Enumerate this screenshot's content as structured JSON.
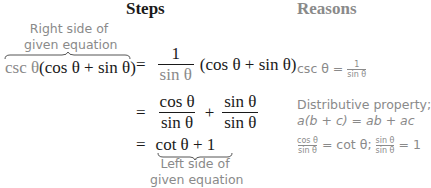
{
  "headers": {
    "steps": "Steps",
    "reasons": "Reasons"
  },
  "annotations": {
    "top": [
      "Right side of",
      "given equation"
    ],
    "bottom": [
      "Left side of",
      "given equation"
    ]
  },
  "steps": [
    {
      "lhs_gray": "csc θ",
      "lhs_rest": "(cos θ + sin θ)",
      "eq": "=",
      "frac_num": "1",
      "frac_den": "sin θ",
      "tail": "(cos θ + sin θ)"
    },
    {
      "eq": "=",
      "f1_num": "cos θ",
      "f1_den": "sin θ",
      "op": "+",
      "f2_num": "sin θ",
      "f2_den": "sin θ"
    },
    {
      "eq": "=",
      "expr": "cot θ + 1"
    }
  ],
  "reasons": [
    {
      "pre": "csc θ =",
      "num": "1",
      "den": "sin θ"
    },
    {
      "line1": "Distributive property;",
      "line2": "a(b + c) = ab + ac"
    },
    {
      "n1": "cos θ",
      "d1": "sin θ",
      "mid": "= cot θ;",
      "n2": "sin θ",
      "d2": "sin θ",
      "post": "= 1"
    }
  ]
}
